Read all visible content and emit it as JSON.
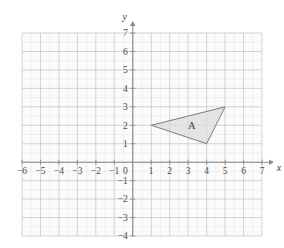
{
  "figure": {
    "title": "",
    "background_color": "#ffffff"
  },
  "chart_data": {
    "type": "scatter",
    "title": "",
    "xlabel": "x",
    "ylabel": "y",
    "xlim": [
      -6,
      7
    ],
    "ylim": [
      -4,
      7
    ],
    "grid": true,
    "grid_major_step": 1,
    "grid_minor_step": 0.5,
    "x_ticks": [
      -6,
      -5,
      -4,
      -3,
      -2,
      -1,
      0,
      1,
      2,
      3,
      4,
      5,
      6,
      7
    ],
    "y_ticks": [
      -4,
      -3,
      -2,
      -1,
      0,
      1,
      2,
      3,
      4,
      5,
      6,
      7
    ],
    "x_tick_labels": [
      "−6",
      "−5",
      "−4",
      "−3",
      "−2",
      "−1",
      "0",
      "1",
      "2",
      "3",
      "4",
      "5",
      "6",
      "7"
    ],
    "y_tick_labels": [
      "−4",
      "−3",
      "−2",
      "−1",
      "0",
      "1",
      "2",
      "3",
      "4",
      "5",
      "6",
      "7"
    ],
    "origin_label": "0",
    "legend": null,
    "shapes": [
      {
        "name": "triangle-a",
        "label": "A",
        "type": "polygon",
        "vertices": [
          [
            1,
            2
          ],
          [
            5,
            3
          ],
          [
            4,
            1
          ]
        ],
        "label_position": [
          3.2,
          1.95
        ],
        "fill": "#dcdcdc",
        "fill_opacity": 0.75,
        "stroke": "#6e6e6e",
        "stroke_width": 0.9
      }
    ]
  },
  "axes": {
    "x_axis_name": "x",
    "y_axis_name": "y",
    "x_axis_arrow": true,
    "y_axis_arrow": true,
    "axis_color": "#8a8a8a",
    "grid_major_color": "#c8c8c8",
    "grid_minor_color": "#e8e8e8",
    "plot_fill": "#fbfbfb"
  },
  "colors": {
    "shape_fill": "#dcdcdc",
    "shape_stroke": "#6e6e6e",
    "tick_text": "#4a4a4a",
    "axis_line": "#8a8a8a"
  }
}
